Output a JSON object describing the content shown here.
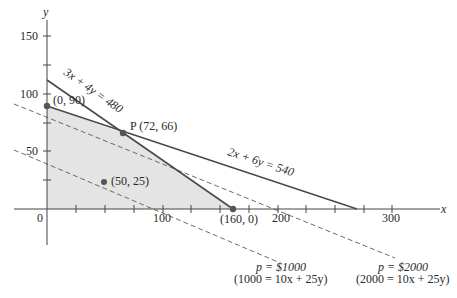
{
  "diagram": {
    "type": "linear-programming-feasible-region",
    "axes": {
      "x_label": "x",
      "y_label": "y",
      "x_ticks": [
        "0",
        "100",
        "200",
        "300"
      ],
      "y_ticks": [
        "50",
        "100",
        "150"
      ]
    },
    "points": [
      {
        "label": "(0, 90)",
        "x": 0,
        "y": 90
      },
      {
        "label": "P (72, 66)",
        "x": 72,
        "y": 66
      },
      {
        "label": "(160, 0)",
        "x": 160,
        "y": 0
      },
      {
        "label": "(50, 25)",
        "x": 50,
        "y": 25
      }
    ],
    "constraints": [
      {
        "label": "3x + 4y = 480"
      },
      {
        "label": "2x + 6y = 540"
      }
    ],
    "isoprofit_lines": [
      {
        "label": "p = $1000",
        "equation": "(1000 = 10x + 25y)"
      },
      {
        "label": "p = $2000",
        "equation": "(2000 = 10x + 25y)"
      }
    ],
    "colors": {
      "feasible_region": "#e4e4e4",
      "lines": "#4a4a4a",
      "dashed": "#5a5a5a",
      "points": "#555555"
    }
  }
}
